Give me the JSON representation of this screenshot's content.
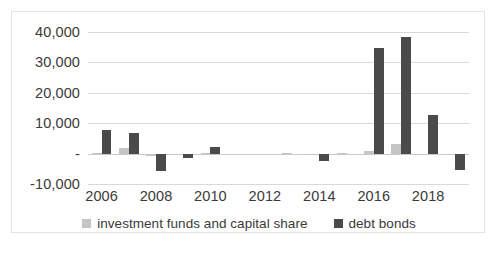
{
  "chart_data": {
    "type": "bar",
    "title": "",
    "subtitle": "",
    "xlabel": "",
    "ylabel": "",
    "categories": [
      "2006",
      "2007",
      "2008",
      "2009",
      "2010",
      "2011",
      "2012",
      "2013",
      "2014",
      "2015",
      "2016",
      "2017",
      "2018",
      "2019"
    ],
    "x_tick_labels": [
      "2006",
      "2008",
      "2010",
      "2012",
      "2014",
      "2016",
      "2018"
    ],
    "y_tick_labels": [
      "40,000",
      "30,000",
      "20,000",
      "10,000",
      "-",
      "-10,000"
    ],
    "y_tick_values": [
      40000,
      30000,
      20000,
      10000,
      0,
      -10000
    ],
    "ylim": [
      -10000,
      40000
    ],
    "grid": true,
    "legend_position": "bottom",
    "series": [
      {
        "name": "investment funds and capital share",
        "color": "#c5c5c5",
        "values": [
          300,
          1900,
          -700,
          -200,
          100,
          0,
          0,
          300,
          -100,
          100,
          900,
          3100,
          -400,
          0
        ]
      },
      {
        "name": "debt bonds",
        "color": "#4a4a4a",
        "values": [
          7700,
          6700,
          -5800,
          -1300,
          2200,
          0,
          0,
          0,
          -2600,
          0,
          34800,
          38200,
          12700,
          -5500
        ]
      }
    ]
  },
  "legend": {
    "items": [
      {
        "label": "investment funds and capital share",
        "swatch": "series-a"
      },
      {
        "label": "debt bonds",
        "swatch": "series-b"
      }
    ]
  },
  "colors": {
    "series_a": "#c5c5c5",
    "series_b": "#4a4a4a",
    "gridline": "#d9d9d9",
    "text": "#3a3a3a",
    "frame_border": "#e2e2e2",
    "background": "#ffffff"
  }
}
